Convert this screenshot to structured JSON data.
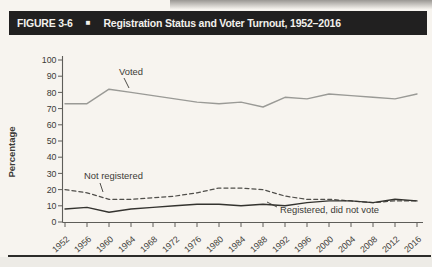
{
  "figure": {
    "label": "FIGURE 3-6",
    "marker": "■",
    "title": "Registration Status and Voter Turnout, 1952–2016"
  },
  "chart_data": {
    "type": "line",
    "x": [
      1952,
      1956,
      1960,
      1964,
      1968,
      1972,
      1976,
      1980,
      1984,
      1988,
      1992,
      1996,
      2000,
      2004,
      2008,
      2012,
      2016
    ],
    "series": [
      {
        "name": "Voted",
        "values": [
          73,
          73,
          82,
          80,
          78,
          76,
          74,
          73,
          74,
          71,
          77,
          76,
          79,
          78,
          77,
          76,
          79
        ],
        "color": "#9a9a96",
        "line_style": "solid"
      },
      {
        "name": "Not registered",
        "values": [
          20,
          18,
          14,
          14,
          15,
          16,
          18,
          21,
          21,
          20,
          16,
          14,
          14,
          13,
          12,
          13,
          13
        ],
        "color": "#504f4b",
        "line_style": "dashed"
      },
      {
        "name": "Registered, did not vote",
        "values": [
          8,
          9,
          6,
          8,
          9,
          10,
          11,
          11,
          10,
          11,
          10,
          12,
          13,
          13,
          12,
          14,
          13
        ],
        "color": "#34332f",
        "line_style": "solid"
      }
    ],
    "ylabel": "Percentage",
    "ylim": [
      0,
      100
    ],
    "yticks": [
      0,
      10,
      20,
      30,
      40,
      50,
      60,
      70,
      80,
      90,
      100
    ],
    "grid": false,
    "legend_position": "inline annotations near lines",
    "annotations": [
      {
        "text": "Voted"
      },
      {
        "text": "Not registered"
      },
      {
        "text": "Registered, did not vote"
      }
    ]
  },
  "colors": {
    "header_bg": "#212020",
    "header_text": "#f2f0ec",
    "page_bg": "#f7f4ef",
    "axis": "#5e5d59",
    "tick_text": "#3b3a36"
  }
}
